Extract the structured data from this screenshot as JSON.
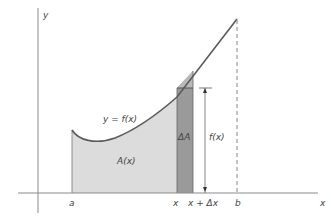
{
  "diagram": {
    "type": "area-under-curve",
    "curve_label": "y = f(x)",
    "area_label": "A(x)",
    "strip_label": "ΔA",
    "height_label": "f(x)",
    "axes": {
      "x_label": "x",
      "y_label": "y"
    },
    "ticks": {
      "a": "a",
      "x": "x",
      "x_plus_dx": "x + Δx",
      "b": "b"
    },
    "colors": {
      "curve": "#5a5a5a",
      "area_fill": "#dcdcdc",
      "strip_fill": "#9a9a9a",
      "axis": "#8a8a8a"
    }
  }
}
